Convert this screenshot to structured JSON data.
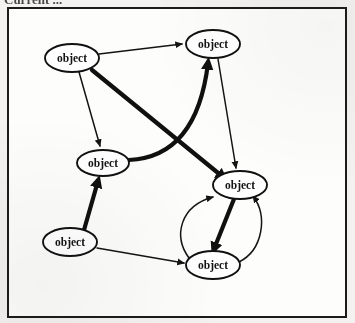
{
  "figure": {
    "caption_fragment": "Current ...",
    "frame": {
      "x": 7,
      "y": 7,
      "width": 340,
      "height": 311,
      "border_color": "#1b1b1b",
      "fill_color": "#fdfdfc"
    },
    "page_background": "#f3f2f0"
  },
  "graph_data": {
    "type": "diagram",
    "kind": "directed-graph",
    "node_shape": "ellipse",
    "node_label_color": "#141414",
    "edge_color": "#141414",
    "node_count": 6,
    "edge_count": 10,
    "nodes": [
      {
        "id": "n1",
        "label": "object",
        "cx": 72,
        "cy": 58,
        "rx": 27,
        "ry": 14
      },
      {
        "id": "n2",
        "label": "object",
        "cx": 213,
        "cy": 44,
        "rx": 27,
        "ry": 14
      },
      {
        "id": "n3",
        "label": "object",
        "cx": 103,
        "cy": 163,
        "rx": 26,
        "ry": 13
      },
      {
        "id": "n4",
        "label": "object",
        "cx": 70,
        "cy": 242,
        "rx": 27,
        "ry": 14
      },
      {
        "id": "n5",
        "label": "object",
        "cx": 240,
        "cy": 185,
        "rx": 27,
        "ry": 14
      },
      {
        "id": "n6",
        "label": "object",
        "cx": 213,
        "cy": 265,
        "rx": 27,
        "ry": 14
      }
    ],
    "edges": [
      {
        "id": "e1",
        "from": "n1",
        "to": "n2",
        "weight": "thin",
        "shape": "straight"
      },
      {
        "id": "e2",
        "from": "n1",
        "to": "n3",
        "weight": "thin",
        "shape": "straight"
      },
      {
        "id": "e3",
        "from": "n1",
        "to": "n5",
        "weight": "thick",
        "shape": "straight"
      },
      {
        "id": "e4",
        "from": "n3",
        "to": "n2",
        "weight": "thick",
        "shape": "curved"
      },
      {
        "id": "e5",
        "from": "n2",
        "to": "n5",
        "weight": "thin",
        "shape": "straight"
      },
      {
        "id": "e6",
        "from": "n4",
        "to": "n3",
        "weight": "thick",
        "shape": "straight"
      },
      {
        "id": "e7",
        "from": "n4",
        "to": "n6",
        "weight": "thin",
        "shape": "straight"
      },
      {
        "id": "e8",
        "from": "n5",
        "to": "n6",
        "weight": "thick",
        "shape": "straight"
      },
      {
        "id": "e9",
        "from": "n6",
        "to": "n5",
        "weight": "thin",
        "shape": "curved-left"
      },
      {
        "id": "e10",
        "from": "n6",
        "to": "n5",
        "weight": "thin",
        "shape": "curved-right"
      }
    ]
  }
}
